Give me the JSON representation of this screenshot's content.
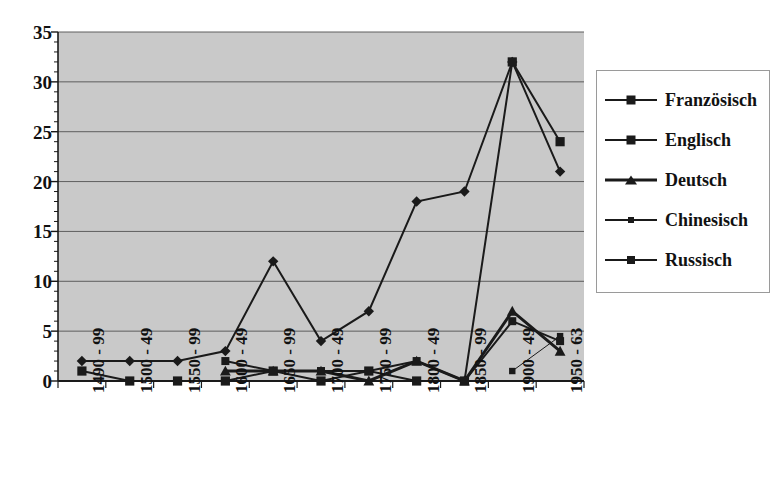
{
  "chart_data": {
    "type": "line",
    "title": "",
    "xlabel": "",
    "ylabel": "",
    "ylim": [
      0,
      35
    ],
    "ytick_step": 5,
    "yticks": [
      0,
      5,
      10,
      15,
      20,
      25,
      30,
      35
    ],
    "grid": true,
    "legend_position": "right",
    "categories": [
      "1490 - 99",
      "1500 - 49",
      "1550 - 99",
      "1600 - 49",
      "1650 - 99",
      "1700 - 49",
      "1750 - 99",
      "1800 - 49",
      "1850 - 99",
      "1900 - 49",
      "1950 - 63"
    ],
    "series": [
      {
        "name": "Französisch",
        "marker": "diamond",
        "line_width": 2,
        "color": "#1a1a1a",
        "values": [
          2,
          2,
          2,
          3,
          12,
          4,
          7,
          18,
          19,
          32,
          21
        ]
      },
      {
        "name": "Englisch",
        "marker": "square",
        "line_width": 2,
        "color": "#1a1a1a",
        "values": [
          1,
          0,
          0,
          0,
          1,
          0,
          1,
          0,
          0,
          32,
          24
        ]
      },
      {
        "name": "Deutsch",
        "marker": "triangle",
        "line_width": 3,
        "color": "#1a1a1a",
        "values": [
          null,
          null,
          null,
          1,
          1,
          1,
          0,
          2,
          0,
          7,
          3
        ]
      },
      {
        "name": "Chinesisch",
        "marker": "smallsquare",
        "line_width": 1,
        "color": "#1a1a1a",
        "values": [
          null,
          null,
          null,
          null,
          null,
          null,
          null,
          null,
          null,
          1,
          4.5
        ]
      },
      {
        "name": "Russisch",
        "marker": "xsquare",
        "line_width": 2,
        "color": "#1a1a1a",
        "values": [
          null,
          null,
          null,
          2,
          1,
          1,
          1,
          2,
          0,
          6,
          4
        ]
      }
    ]
  },
  "legend": {
    "items": [
      {
        "label": "Französisch",
        "marker": "diamond"
      },
      {
        "label": "Englisch",
        "marker": "square"
      },
      {
        "label": "Deutsch",
        "marker": "triangle"
      },
      {
        "label": "Chinesisch",
        "marker": "smallsquare"
      },
      {
        "label": "Russisch",
        "marker": "xsquare"
      }
    ]
  },
  "style": {
    "plot_background": "#c9c9c9",
    "gridline_color": "#5e5e5e",
    "axis_color": "#1a1a1a",
    "series_color": "#1a1a1a",
    "page_background": "#ffffff"
  },
  "watermark": {
    "lines": [
      "",
      "",
      ""
    ]
  }
}
